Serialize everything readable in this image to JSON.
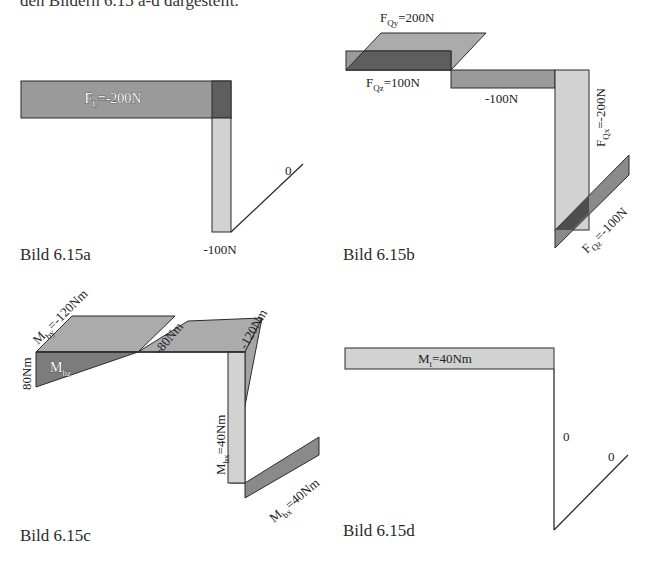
{
  "top_text": "den Bildern 6.15 a-d dargestellt.",
  "figures": [
    {
      "caption": "Bild 6.15a",
      "labels": {
        "main": "F",
        "main_sub": "L",
        "main_value": "=-200N",
        "vertical_value": "-100N",
        "diagonal_value": "0"
      }
    },
    {
      "caption": "Bild 6.15b",
      "labels": {
        "fqy": "F",
        "fqy_sub": "Qy",
        "fqy_value": "=200N",
        "fqz": "F",
        "fqz_sub": "Qz",
        "fqz_value": "=100N",
        "mid_value": "-100N",
        "fqx": "F",
        "fqx_sub": "Qx",
        "fqx_value": "=-200N",
        "fqz2": "F",
        "fqz2_sub": "Qz",
        "fqz2_value": "=-100N"
      }
    },
    {
      "caption": "Bild 6.15c",
      "labels": {
        "mby": "M",
        "mby_sub": "by",
        "mby_value": "=-120Nm",
        "left_value": "80Nm",
        "mbz": "M",
        "mbz_sub": "bz",
        "mid_value": "-80Nm",
        "corner_value": "-120Nm",
        "mbx": "M",
        "mbx_sub": "bx",
        "mbx_value": "=40Nm",
        "mbx2": "M",
        "mbx2_sub": "bx",
        "mbx2_value": "=40Nm"
      }
    },
    {
      "caption": "Bild 6.15d",
      "labels": {
        "mt": "M",
        "mt_sub": "t",
        "mt_value": "=40Nm",
        "vertical_value": "0",
        "diagonal_value": "0"
      }
    }
  ],
  "colors": {
    "mid_gray": "#9a9a9a",
    "light_gray": "#d2d2d2",
    "dark_gray": "#5e5e5e",
    "outline": "#2b2b2b"
  }
}
